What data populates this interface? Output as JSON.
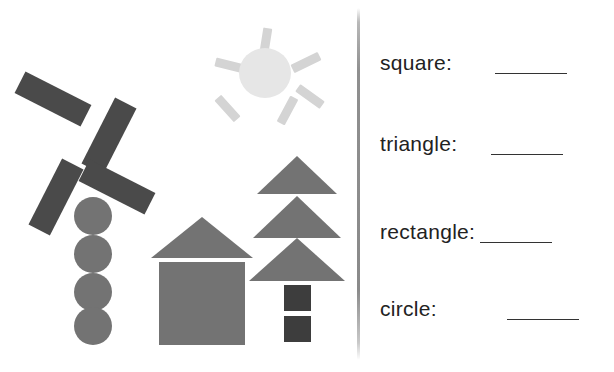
{
  "worksheet": {
    "title": "Count the shapes worksheet",
    "palette": {
      "background": "#ffffff",
      "shape_dark": "#4a4a4a",
      "shape_medium": "#737373",
      "sun_body": "#e6e6e6",
      "sun_rays": "#d4d4d4",
      "divider": "#8a8a8a",
      "text": "#222222",
      "blank_line": "#333333"
    }
  },
  "illustration": {
    "name": "shape-scene",
    "objects": [
      {
        "name": "windmill",
        "parts": [
          {
            "name": "windmill-blade-upper-left",
            "shape": "rectangle",
            "color": "#4a4a4a"
          },
          {
            "name": "windmill-blade-upper-right",
            "shape": "rectangle",
            "color": "#4a4a4a"
          },
          {
            "name": "windmill-blade-lower-left",
            "shape": "rectangle",
            "color": "#4a4a4a"
          },
          {
            "name": "windmill-blade-lower-right",
            "shape": "rectangle",
            "color": "#4a4a4a"
          },
          {
            "name": "windmill-tower-circle-1",
            "shape": "circle",
            "color": "#737373"
          },
          {
            "name": "windmill-tower-circle-2",
            "shape": "circle",
            "color": "#737373"
          },
          {
            "name": "windmill-tower-circle-3",
            "shape": "circle",
            "color": "#737373"
          },
          {
            "name": "windmill-tower-circle-4",
            "shape": "circle",
            "color": "#737373"
          }
        ]
      },
      {
        "name": "sun",
        "parts": [
          {
            "name": "sun-body",
            "shape": "circle",
            "color": "#e6e6e6"
          },
          {
            "name": "sun-ray-top",
            "shape": "rectangle",
            "color": "#d4d4d4"
          },
          {
            "name": "sun-ray-upper-right",
            "shape": "rectangle",
            "color": "#d4d4d4"
          },
          {
            "name": "sun-ray-lower-right",
            "shape": "rectangle",
            "color": "#d4d4d4"
          },
          {
            "name": "sun-ray-lower-left",
            "shape": "rectangle",
            "color": "#d4d4d4"
          },
          {
            "name": "sun-ray-upper-left",
            "shape": "rectangle",
            "color": "#d4d4d4"
          },
          {
            "name": "sun-ray-right",
            "shape": "rectangle",
            "color": "#d4d4d4"
          }
        ]
      },
      {
        "name": "house",
        "parts": [
          {
            "name": "house-roof",
            "shape": "triangle",
            "color": "#737373"
          },
          {
            "name": "house-body",
            "shape": "square",
            "color": "#737373"
          }
        ]
      },
      {
        "name": "tree",
        "parts": [
          {
            "name": "tree-foliage-top",
            "shape": "triangle",
            "color": "#737373"
          },
          {
            "name": "tree-foliage-middle",
            "shape": "triangle",
            "color": "#737373"
          },
          {
            "name": "tree-foliage-bottom",
            "shape": "triangle",
            "color": "#737373"
          },
          {
            "name": "tree-trunk-upper",
            "shape": "square",
            "color": "#3d3d3d"
          },
          {
            "name": "tree-trunk-lower",
            "shape": "square",
            "color": "#3d3d3d"
          }
        ]
      }
    ]
  },
  "answers": {
    "rows": [
      {
        "label": "square:",
        "value": ""
      },
      {
        "label": "triangle:",
        "value": ""
      },
      {
        "label": "rectangle:",
        "value": ""
      },
      {
        "label": "circle:",
        "value": ""
      }
    ]
  }
}
